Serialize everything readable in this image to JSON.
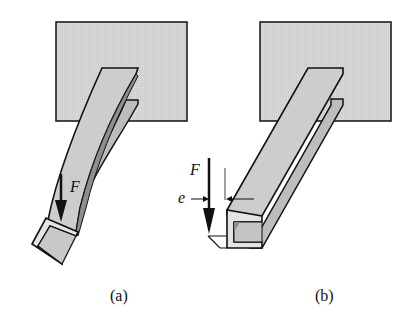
{
  "figure": {
    "panels": [
      {
        "id": "a",
        "caption": "(a)",
        "description": "Channel cantilever twisted and bent by load through web",
        "load_label": "F"
      },
      {
        "id": "b",
        "caption": "(b)",
        "description": "Channel cantilever with load applied at shear center offset e",
        "load_label": "F",
        "offset_label": "e"
      }
    ],
    "colors": {
      "support": "#d6d6d6",
      "beam_light": "#cfcfcf",
      "beam_mid": "#bdbdbd",
      "beam_dark": "#8e8e8e",
      "outline": "#111111"
    }
  }
}
